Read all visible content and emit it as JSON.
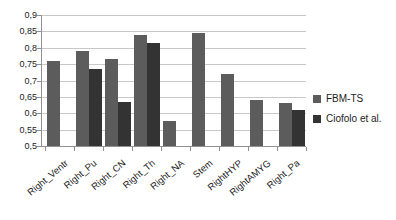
{
  "chart_data": {
    "type": "bar",
    "categories": [
      "Right_Ventr",
      "Right_Pu",
      "Right_CN",
      "Right_Th",
      "Right_NA",
      "Stem",
      "RightHYP",
      "RightAMYG",
      "Right_Pa"
    ],
    "series": [
      {
        "name": "FBM-TS",
        "color": "#5c5c5c",
        "values": [
          0.76,
          0.79,
          0.765,
          0.84,
          0.575,
          0.845,
          0.72,
          0.64,
          0.63
        ]
      },
      {
        "name": "Ciofolo et al.",
        "color": "#333333",
        "values": [
          null,
          0.735,
          0.635,
          0.815,
          null,
          null,
          null,
          null,
          0.61
        ]
      }
    ],
    "ylim": [
      0.5,
      0.9
    ],
    "ytick_step": 0.05,
    "ytick_labels": [
      "0,5",
      "0,55",
      "0,6",
      "0,65",
      "0,7",
      "0,75",
      "0,8",
      "0,85",
      "0,9"
    ],
    "grid": true,
    "legend_position": "right",
    "colors": {
      "grid": "#c8c8c8",
      "axis": "#919191",
      "text": "#1c1c1c",
      "background": "#ffffff"
    }
  }
}
